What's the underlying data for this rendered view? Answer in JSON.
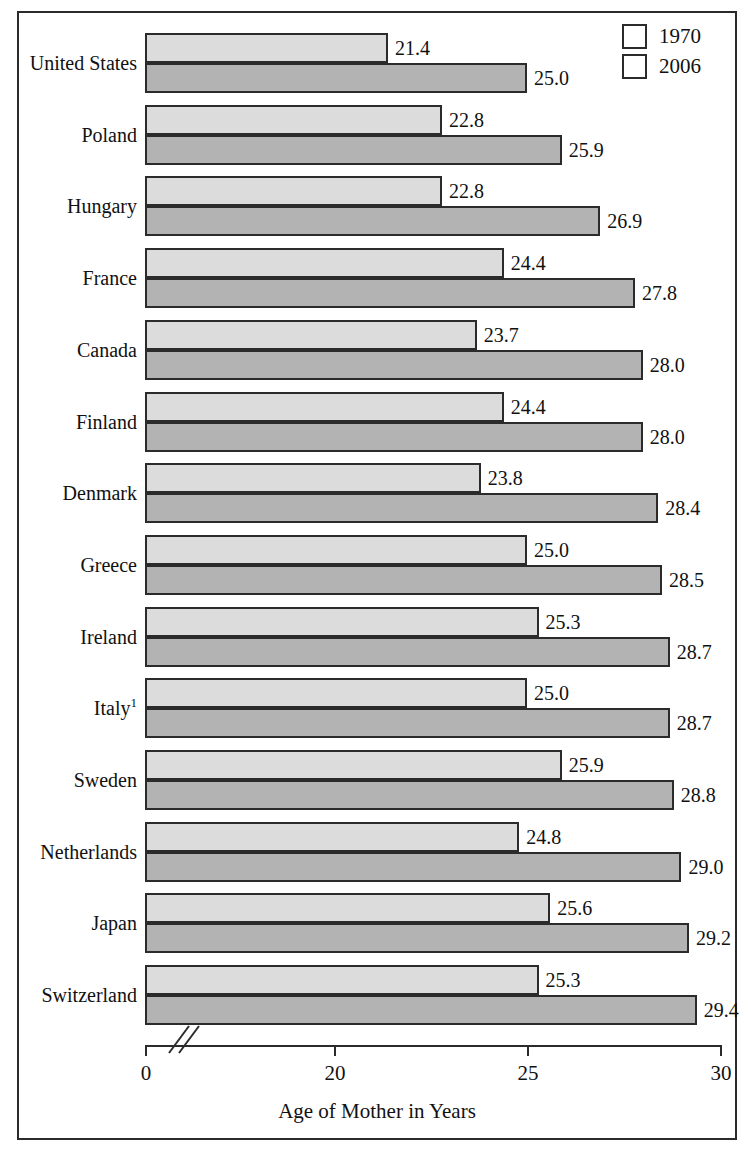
{
  "legend": {
    "position": "top-right",
    "entries": [
      {
        "label": "1970",
        "color": "#dcdcdc",
        "icon": "legend-swatch-icon"
      },
      {
        "label": "2006",
        "color": "#b3b3b3",
        "icon": "legend-swatch-icon"
      }
    ]
  },
  "axis": {
    "title": "Age of Mother in Years",
    "ticks": [
      "0",
      "20",
      "25",
      "30"
    ],
    "break_marker": "axis-break-icon"
  },
  "footnote_marker": "1",
  "chart_data": {
    "type": "bar",
    "orientation": "horizontal",
    "title": "",
    "subtitle": "",
    "xlabel": "Age of Mother in Years",
    "ylabel": "",
    "xlim": [
      0,
      30
    ],
    "x_axis_broken": true,
    "x_axis_break_between": [
      0,
      20
    ],
    "xticks": [
      0,
      20,
      25,
      30
    ],
    "grid": false,
    "legend_position": "top-right",
    "categories": [
      "United States",
      "Poland",
      "Hungary",
      "France",
      "Canada",
      "Finland",
      "Denmark",
      "Greece",
      "Ireland",
      "Italy",
      "Sweden",
      "Netherlands",
      "Japan",
      "Switzerland"
    ],
    "category_footnotes": {
      "Italy": "1"
    },
    "series": [
      {
        "name": "1970",
        "color": "#dcdcdc",
        "values": [
          21.4,
          22.8,
          22.8,
          24.4,
          23.7,
          24.4,
          23.8,
          25.0,
          25.3,
          25.0,
          25.9,
          24.8,
          25.6,
          25.3
        ],
        "labels": [
          "21.4",
          "22.8",
          "22.8",
          "24.4",
          "23.7",
          "24.4",
          "23.8",
          "25.0",
          "25.3",
          "25.0",
          "25.9",
          "24.8",
          "25.6",
          "25.3"
        ]
      },
      {
        "name": "2006",
        "color": "#b3b3b3",
        "values": [
          25.0,
          25.9,
          26.9,
          27.8,
          28.0,
          28.0,
          28.4,
          28.5,
          28.7,
          28.7,
          28.8,
          29.0,
          29.2,
          29.4
        ],
        "labels": [
          "25.0",
          "25.9",
          "26.9",
          "27.8",
          "28.0",
          "28.0",
          "28.4",
          "28.5",
          "28.7",
          "28.7",
          "28.8",
          "29.0",
          "29.2",
          "29.4"
        ]
      }
    ]
  }
}
